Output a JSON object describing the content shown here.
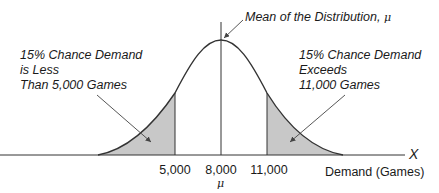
{
  "annotations": {
    "mean": {
      "text": "Mean of the Distribution, ",
      "symbol": "μ"
    },
    "left_tail": {
      "line1": "15% Chance Demand",
      "line2": "is Less",
      "line3": "Than 5,000 Games"
    },
    "right_tail": {
      "line1": "15% Chance Demand",
      "line2": "Exceeds",
      "line3": "11,000 Games"
    }
  },
  "axis": {
    "x_symbol": "X",
    "x_label": "Demand (Games)",
    "ticks": [
      {
        "label": "5,000"
      },
      {
        "label": "8,000",
        "sub": "μ"
      },
      {
        "label": "11,000"
      }
    ]
  },
  "colors": {
    "shade": "#c8c8c8",
    "line": "#333333"
  }
}
